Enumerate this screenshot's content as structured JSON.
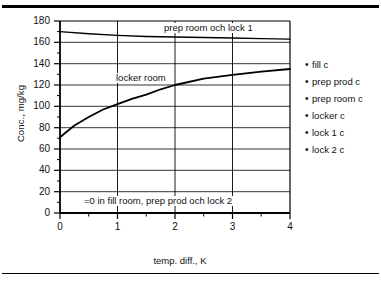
{
  "chart_data": {
    "type": "line",
    "title": "",
    "xlabel": "temp. diff., K",
    "ylabel": "Conc., mg/kg",
    "xlim": [
      0,
      4
    ],
    "ylim": [
      0,
      180
    ],
    "xticks": [
      "0",
      "1",
      "2",
      "3",
      "4"
    ],
    "yticks": [
      "0",
      "20",
      "40",
      "60",
      "80",
      "100",
      "120",
      "140",
      "160",
      "180"
    ],
    "grid": "both",
    "legend_position": "right",
    "series": [
      {
        "name": "prep room och lock 1",
        "x": [
          0,
          0.5,
          1,
          1.5,
          2,
          2.5,
          3,
          3.5,
          4
        ],
        "values": [
          170,
          168,
          166.5,
          165.5,
          165,
          164.5,
          164,
          163.5,
          163
        ]
      },
      {
        "name": "locker room",
        "x": [
          0,
          0.25,
          0.5,
          0.75,
          1,
          1.25,
          1.5,
          1.75,
          2,
          2.5,
          3,
          3.5,
          4
        ],
        "values": [
          71,
          82,
          90,
          97,
          102,
          107,
          111,
          116,
          120,
          126,
          129.5,
          132.5,
          135
        ]
      },
      {
        "name": "fill room, prep prod och lock 2",
        "x": [
          0,
          4
        ],
        "values": [
          0,
          0
        ]
      }
    ],
    "annotations": [
      {
        "text": "prep room och lock 1",
        "x": 2.05,
        "y": 173
      },
      {
        "text": "locker room",
        "x": 0.95,
        "y": 131
      },
      {
        "text": "=0 in fill room, prep prod och lock 2",
        "x": 1.7,
        "y": 9
      }
    ]
  },
  "legend": {
    "bullet": "•",
    "items": [
      {
        "label": "fill c"
      },
      {
        "label": "prep prod c"
      },
      {
        "label": "prep room c"
      },
      {
        "label": "locker c"
      },
      {
        "label": "lock 1 c"
      },
      {
        "label": "lock 2 c"
      }
    ]
  },
  "colors": {
    "axis": "#000000",
    "grid": "#000000",
    "series": "#000000",
    "background": "#ffffff"
  }
}
